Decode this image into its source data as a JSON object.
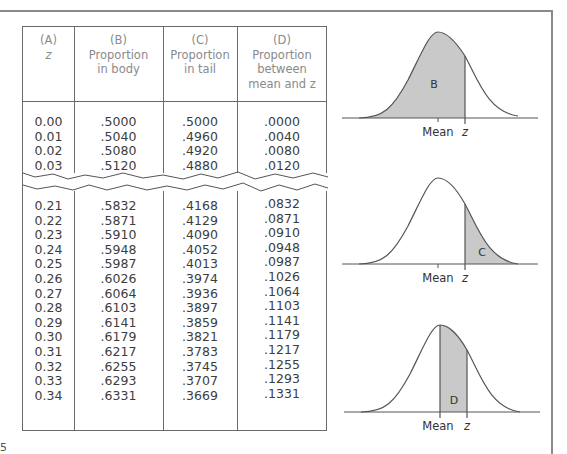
{
  "page": {
    "page_number_fragment": "5"
  },
  "table": {
    "headers": [
      {
        "letter": "(A)",
        "lines": [
          "z"
        ]
      },
      {
        "letter": "(B)",
        "lines": [
          "Proportion",
          "in body"
        ]
      },
      {
        "letter": "(C)",
        "lines": [
          "Proportion",
          "in tail"
        ]
      },
      {
        "letter": "(D)",
        "lines": [
          "Proportion",
          "between",
          "mean and z"
        ]
      }
    ],
    "top_block": {
      "z": [
        "0.00",
        "0.01",
        "0.02",
        "0.03"
      ],
      "body": [
        ".5000",
        ".5040",
        ".5080",
        ".5120"
      ],
      "tail": [
        ".5000",
        ".4960",
        ".4920",
        ".4880"
      ],
      "between": [
        ".0000",
        ".0040",
        ".0080",
        ".0120"
      ]
    },
    "bottom_block": {
      "z": [
        "0.21",
        "0.22",
        "0.23",
        "0.24",
        "0.25",
        "0.26",
        "0.27",
        "0.28",
        "0.29",
        "0.30",
        "0.31",
        "0.32",
        "0.33",
        "0.34"
      ],
      "body": [
        ".5832",
        ".5871",
        ".5910",
        ".5948",
        ".5987",
        ".6026",
        ".6064",
        ".6103",
        ".6141",
        ".6179",
        ".6217",
        ".6255",
        ".6293",
        ".6331"
      ],
      "tail": [
        ".4168",
        ".4129",
        ".4090",
        ".4052",
        ".4013",
        ".3974",
        ".3936",
        ".3897",
        ".3859",
        ".3821",
        ".3783",
        ".3745",
        ".3707",
        ".3669"
      ],
      "between": [
        ".0832",
        ".0871",
        ".0910",
        ".0948",
        ".0987",
        ".1026",
        ".1064",
        ".1103",
        ".1141",
        ".1179",
        ".1217",
        ".1255",
        ".1293",
        ".1331"
      ]
    },
    "break_indicator": "zigzag"
  },
  "diagrams": [
    {
      "region_label": "B",
      "mean_label": "Mean",
      "z_label": "z",
      "shaded": "left of z (body)"
    },
    {
      "region_label": "C",
      "mean_label": "Mean",
      "z_label": "z",
      "shaded": "right of z (tail)"
    },
    {
      "region_label": "D",
      "mean_label": "Mean",
      "z_label": "z",
      "shaded": "between mean and z"
    }
  ],
  "colors": {
    "shade": "#c9c9c9",
    "line": "#555555",
    "rule": "#8a8a8a"
  }
}
